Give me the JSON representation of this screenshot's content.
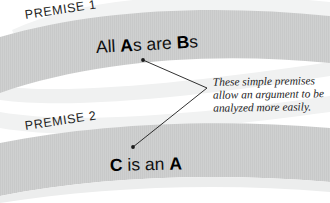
{
  "figure": {
    "background_color": "#ffffff",
    "band_color": "#cfd0d0",
    "band_shadow_color": "#e9eaea",
    "text_color": "#111111",
    "leader_color": "#1a1a1a"
  },
  "premises": [
    {
      "tag": "PREMISE 1",
      "statement_parts": [
        {
          "text": "All ",
          "bold": false
        },
        {
          "text": "A",
          "bold": true
        },
        {
          "text": "s are ",
          "bold": false
        },
        {
          "text": "B",
          "bold": true
        },
        {
          "text": "s",
          "bold": false
        }
      ],
      "statement_plain": "All As are Bs"
    },
    {
      "tag": "PREMISE 2",
      "statement_parts": [
        {
          "text": "C",
          "bold": true
        },
        {
          "text": " is an ",
          "bold": false
        },
        {
          "text": "A",
          "bold": true
        }
      ],
      "statement_plain": "C is an A"
    }
  ],
  "annotation": {
    "lines": [
      "These simple premises",
      "allow an argument to be",
      "analyzed more easily."
    ],
    "full_text": "These simple premises allow an argument to be analyzed more easily."
  },
  "leader_lines": {
    "vertex": {
      "x": 207,
      "y": 88
    },
    "endpoints": [
      {
        "x": 143,
        "y": 60
      },
      {
        "x": 133,
        "y": 147
      }
    ]
  }
}
